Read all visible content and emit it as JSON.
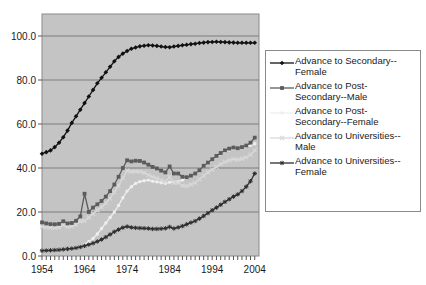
{
  "chart_data": {
    "type": "line",
    "title": "",
    "xlabel": "",
    "ylabel": "",
    "xlim": [
      1954,
      2005
    ],
    "ylim": [
      0,
      110
    ],
    "yticks": [
      "0.0",
      "20.0",
      "40.0",
      "60.0",
      "80.0",
      "100.0"
    ],
    "ytick_values": [
      0,
      20,
      40,
      60,
      80,
      100
    ],
    "xticks": [
      "1954",
      "1964",
      "1974",
      "1984",
      "1994",
      "2004"
    ],
    "xtick_values": [
      1954,
      1964,
      1974,
      1984,
      1994,
      2004
    ],
    "grid": true,
    "legend_position": "right",
    "plot_background": "#c4c4c4",
    "series": [
      {
        "name": "Advance to Secondary--Female",
        "legend_label": "Advance to Secondary--\nFemale",
        "color": "#111111",
        "marker": "diamond",
        "x": [
          1954,
          1955,
          1956,
          1957,
          1958,
          1959,
          1960,
          1961,
          1962,
          1963,
          1964,
          1965,
          1966,
          1967,
          1968,
          1969,
          1970,
          1971,
          1972,
          1973,
          1974,
          1975,
          1976,
          1977,
          1978,
          1979,
          1980,
          1981,
          1982,
          1983,
          1984,
          1985,
          1986,
          1987,
          1988,
          1989,
          1990,
          1991,
          1992,
          1993,
          1994,
          1995,
          1996,
          1997,
          1998,
          1999,
          2000,
          2001,
          2002,
          2003,
          2004
        ],
        "values": [
          46.5,
          47.2,
          48.0,
          49.5,
          51.5,
          54.0,
          57.0,
          60.5,
          63.5,
          66.5,
          69.5,
          72.5,
          75.5,
          78.5,
          81.0,
          83.5,
          86.0,
          88.5,
          90.5,
          92.0,
          93.2,
          94.2,
          94.8,
          95.3,
          95.6,
          95.8,
          95.7,
          95.5,
          95.2,
          95.0,
          94.9,
          95.2,
          95.5,
          95.8,
          96.0,
          96.3,
          96.5,
          96.8,
          97.0,
          97.2,
          97.3,
          97.4,
          97.3,
          97.2,
          97.1,
          97.0,
          96.9,
          96.9,
          96.9,
          96.9,
          96.9
        ]
      },
      {
        "name": "Advance to Post-Secondary--Male",
        "legend_label": "Advance to Post-\nSecondary--Male",
        "color": "#5b5b5b",
        "marker": "square",
        "x": [
          1954,
          1955,
          1956,
          1957,
          1958,
          1959,
          1960,
          1961,
          1962,
          1963,
          1964,
          1965,
          1966,
          1967,
          1968,
          1969,
          1970,
          1971,
          1972,
          1973,
          1974,
          1975,
          1976,
          1977,
          1978,
          1979,
          1980,
          1981,
          1982,
          1983,
          1984,
          1985,
          1986,
          1987,
          1988,
          1989,
          1990,
          1991,
          1992,
          1993,
          1994,
          1995,
          1996,
          1997,
          1998,
          1999,
          2000,
          2001,
          2002,
          2003,
          2004
        ],
        "values": [
          15.3,
          14.8,
          14.5,
          14.4,
          14.6,
          15.8,
          14.8,
          15.0,
          16.0,
          18.0,
          28.3,
          20.0,
          22.0,
          23.5,
          25.0,
          27.0,
          29.5,
          32.5,
          36.0,
          40.0,
          43.5,
          43.0,
          43.3,
          43.2,
          42.5,
          41.5,
          40.5,
          39.8,
          38.8,
          38.0,
          40.7,
          37.5,
          37.5,
          36.0,
          35.8,
          36.5,
          37.5,
          39.0,
          41.0,
          42.5,
          44.0,
          45.5,
          46.8,
          48.0,
          48.8,
          49.3,
          49.0,
          49.5,
          50.2,
          51.5,
          53.8
        ]
      },
      {
        "name": "Advance to Post-Secondary--Female",
        "legend_label": "Advance to Post-\nSecondary--Female",
        "color": "#eeeeee",
        "marker": "dot",
        "x": [
          1954,
          1955,
          1956,
          1957,
          1958,
          1959,
          1960,
          1961,
          1962,
          1963,
          1964,
          1965,
          1966,
          1967,
          1968,
          1969,
          1970,
          1971,
          1972,
          1973,
          1974,
          1975,
          1976,
          1977,
          1978,
          1979,
          1980,
          1981,
          1982,
          1983,
          1984,
          1985,
          1986,
          1987,
          1988,
          1989,
          1990,
          1991,
          1992,
          1993,
          1994,
          1995,
          1996,
          1997,
          1998,
          1999,
          2000,
          2001,
          2002,
          2003,
          2004
        ],
        "values": [
          2.5,
          2.6,
          2.7,
          2.8,
          2.9,
          3.1,
          3.3,
          3.6,
          4.0,
          4.5,
          5.3,
          6.5,
          8.0,
          10.0,
          12.5,
          15.0,
          17.5,
          20.0,
          23.0,
          26.5,
          29.5,
          31.5,
          33.0,
          33.8,
          34.2,
          34.5,
          34.0,
          33.7,
          33.3,
          33.0,
          33.5,
          33.5,
          33.8,
          34.5,
          35.5,
          36.5,
          37.5,
          39.0,
          41.0,
          42.8,
          44.2,
          45.5,
          46.5,
          47.5,
          48.2,
          48.8,
          49.0,
          49.3,
          49.8,
          50.3,
          51.0
        ]
      },
      {
        "name": "Advance to Universities--Male",
        "legend_label": "Advance to Universities--\nMale",
        "color": "#d8d8d8",
        "marker": "x",
        "x": [
          1954,
          1955,
          1956,
          1957,
          1958,
          1959,
          1960,
          1961,
          1962,
          1963,
          1964,
          1965,
          1966,
          1967,
          1968,
          1969,
          1970,
          1971,
          1972,
          1973,
          1974,
          1975,
          1976,
          1977,
          1978,
          1979,
          1980,
          1981,
          1982,
          1983,
          1984,
          1985,
          1986,
          1987,
          1988,
          1989,
          1990,
          1991,
          1992,
          1993,
          1994,
          1995,
          1996,
          1997,
          1998,
          1999,
          2000,
          2001,
          2002,
          2003,
          2004
        ],
        "values": [
          13.3,
          13.0,
          12.8,
          12.8,
          13.0,
          14.0,
          13.3,
          13.5,
          14.3,
          15.8,
          16.0,
          17.5,
          19.2,
          20.8,
          22.2,
          24.0,
          26.2,
          29.0,
          32.0,
          35.5,
          38.8,
          38.3,
          38.5,
          38.4,
          37.8,
          36.8,
          36.0,
          35.3,
          34.5,
          33.8,
          36.0,
          33.3,
          33.3,
          32.0,
          31.8,
          32.5,
          33.3,
          34.8,
          36.5,
          38.0,
          39.3,
          40.5,
          41.8,
          42.8,
          43.5,
          44.0,
          43.8,
          44.2,
          44.8,
          46.0,
          48.0
        ]
      },
      {
        "name": "Advance to Universities--Female",
        "legend_label": "Advance to Universities--\nFemale",
        "color": "#2e2e2e",
        "marker": "star",
        "x": [
          1954,
          1955,
          1956,
          1957,
          1958,
          1959,
          1960,
          1961,
          1962,
          1963,
          1964,
          1965,
          1966,
          1967,
          1968,
          1969,
          1970,
          1971,
          1972,
          1973,
          1974,
          1975,
          1976,
          1977,
          1978,
          1979,
          1980,
          1981,
          1982,
          1983,
          1984,
          1985,
          1986,
          1987,
          1988,
          1989,
          1990,
          1991,
          1992,
          1993,
          1994,
          1995,
          1996,
          1997,
          1998,
          1999,
          2000,
          2001,
          2002,
          2003,
          2004
        ],
        "values": [
          2.4,
          2.5,
          2.6,
          2.7,
          2.8,
          3.0,
          3.2,
          3.4,
          3.7,
          4.1,
          4.6,
          5.2,
          5.8,
          6.6,
          7.5,
          8.6,
          9.8,
          11.0,
          12.0,
          12.9,
          13.4,
          13.0,
          12.8,
          12.7,
          12.6,
          12.5,
          12.3,
          12.3,
          12.4,
          12.6,
          13.2,
          12.5,
          13.0,
          13.6,
          14.4,
          15.2,
          15.9,
          17.0,
          18.2,
          19.5,
          20.8,
          22.0,
          23.3,
          24.6,
          25.8,
          27.0,
          28.0,
          29.5,
          31.5,
          34.0,
          37.5
        ]
      }
    ]
  }
}
